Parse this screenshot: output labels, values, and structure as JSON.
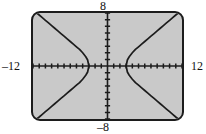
{
  "screen": {
    "device": "graphing-calculator",
    "background_color": "#c9c9c9",
    "border_color": "#1c1c1c"
  },
  "labels": {
    "ymax": "8",
    "ymin": "–8",
    "xmin": "–12",
    "xmax": "12"
  },
  "chart_data": {
    "type": "line",
    "title": "",
    "subtitle": "",
    "xlabel": "",
    "ylabel": "",
    "xlim": [
      -12,
      12
    ],
    "ylim": [
      -8,
      8
    ],
    "grid": false,
    "legend": null,
    "axes": {
      "x_axis_at_y": 0,
      "y_axis_at_x": 0,
      "x_tick_spacing": 1,
      "y_tick_spacing": 1,
      "x_tick_labels": [
        "–12",
        "12"
      ],
      "y_tick_labels": [
        "–8",
        "8"
      ],
      "tick_style": "hash-marks-on-axis"
    },
    "annotations": [
      "Window: Xmin=-12, Xmax=12, Ymin=-8, Ymax=8",
      "Curve: horizontal hyperbola opening left and right",
      "Vertices at approximately x = -3 and x = 3 on the x-axis"
    ],
    "series": [
      {
        "name": "hyperbola-right-upper",
        "color": "#1c1c1c",
        "points": [
          [
            3,
            0
          ],
          [
            3.2,
            0.9
          ],
          [
            3.5,
            1.4
          ],
          [
            4,
            2.0
          ],
          [
            4.5,
            2.5
          ],
          [
            5,
            2.9
          ],
          [
            5.5,
            3.3
          ],
          [
            6,
            3.7
          ],
          [
            6.5,
            4.1
          ],
          [
            7,
            4.5
          ],
          [
            7.5,
            4.9
          ],
          [
            8,
            5.3
          ],
          [
            8.5,
            5.7
          ],
          [
            9,
            6.1
          ],
          [
            9.5,
            6.5
          ],
          [
            10,
            6.9
          ],
          [
            10.5,
            7.3
          ],
          [
            11,
            7.7
          ],
          [
            11.4,
            8
          ]
        ]
      },
      {
        "name": "hyperbola-right-lower",
        "color": "#1c1c1c",
        "points": [
          [
            3,
            0
          ],
          [
            3.2,
            -0.9
          ],
          [
            3.5,
            -1.4
          ],
          [
            4,
            -2.0
          ],
          [
            4.5,
            -2.5
          ],
          [
            5,
            -2.9
          ],
          [
            5.5,
            -3.3
          ],
          [
            6,
            -3.7
          ],
          [
            6.5,
            -4.1
          ],
          [
            7,
            -4.5
          ],
          [
            7.5,
            -4.9
          ],
          [
            8,
            -5.3
          ],
          [
            8.5,
            -5.7
          ],
          [
            9,
            -6.1
          ],
          [
            9.5,
            -6.5
          ],
          [
            10,
            -6.9
          ],
          [
            10.5,
            -7.3
          ],
          [
            11,
            -7.7
          ],
          [
            11.4,
            -8
          ]
        ]
      },
      {
        "name": "hyperbola-left-upper",
        "color": "#1c1c1c",
        "points": [
          [
            -3,
            0
          ],
          [
            -3.2,
            0.9
          ],
          [
            -3.5,
            1.4
          ],
          [
            -4,
            2.0
          ],
          [
            -4.5,
            2.5
          ],
          [
            -5,
            2.9
          ],
          [
            -5.5,
            3.3
          ],
          [
            -6,
            3.7
          ],
          [
            -6.5,
            4.1
          ],
          [
            -7,
            4.5
          ],
          [
            -7.5,
            4.9
          ],
          [
            -8,
            5.3
          ],
          [
            -8.5,
            5.7
          ],
          [
            -9,
            6.1
          ],
          [
            -9.5,
            6.5
          ],
          [
            -10,
            6.9
          ],
          [
            -10.5,
            7.3
          ],
          [
            -11,
            7.7
          ],
          [
            -11.4,
            8
          ]
        ]
      },
      {
        "name": "hyperbola-left-lower",
        "color": "#1c1c1c",
        "points": [
          [
            -3,
            0
          ],
          [
            -3.2,
            -0.9
          ],
          [
            -3.5,
            -1.4
          ],
          [
            -4,
            -2.0
          ],
          [
            -4.5,
            -2.5
          ],
          [
            -5,
            -2.9
          ],
          [
            -5.5,
            -3.3
          ],
          [
            -6,
            -3.7
          ],
          [
            -6.5,
            -4.1
          ],
          [
            -7,
            -4.5
          ],
          [
            -7.5,
            -4.9
          ],
          [
            -8,
            -5.3
          ],
          [
            -8.5,
            -5.7
          ],
          [
            -9,
            -6.1
          ],
          [
            -9.5,
            -6.5
          ],
          [
            -10,
            -6.9
          ],
          [
            -10.5,
            -7.3
          ],
          [
            -11,
            -7.7
          ],
          [
            -11.4,
            -8
          ]
        ]
      }
    ]
  }
}
